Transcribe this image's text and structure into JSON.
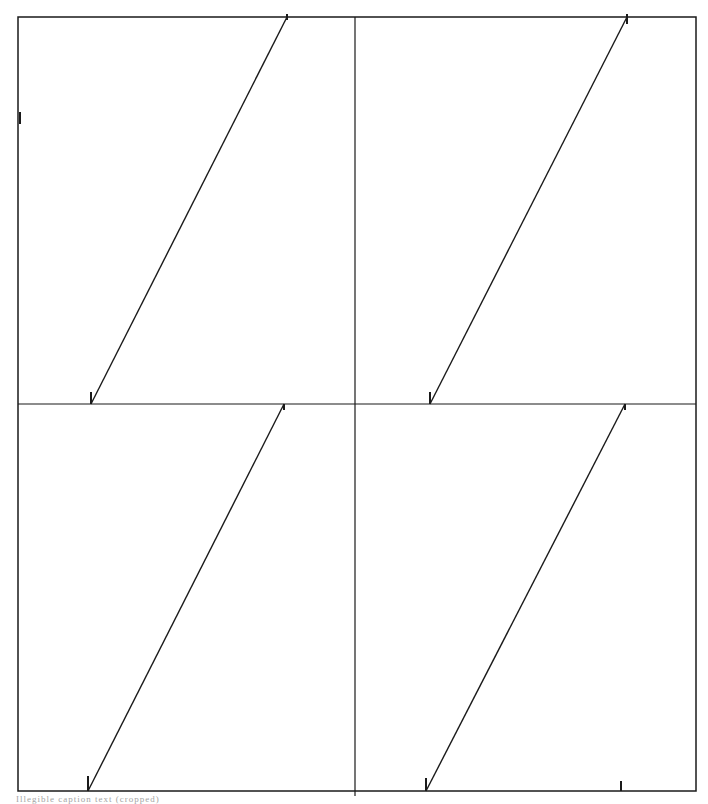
{
  "figure": {
    "stroke_color": "#1a1a1a",
    "background": "#ffffff",
    "frame": {
      "x1": 18,
      "y1": 17,
      "x2": 696,
      "y2": 791
    },
    "dividers": {
      "vertical_x": 355,
      "horizontal_y": 404
    },
    "panels": [
      {
        "id": "top-left",
        "line": {
          "x1": 91,
          "y1": 404,
          "x2": 287,
          "y2": 17
        },
        "ticks": [
          {
            "x": 91,
            "y1": 392,
            "y2": 404
          },
          {
            "x": 287,
            "y1": 14,
            "y2": 20
          }
        ]
      },
      {
        "id": "top-right",
        "line": {
          "x1": 430,
          "y1": 404,
          "x2": 627,
          "y2": 17
        },
        "ticks": [
          {
            "x": 430,
            "y1": 392,
            "y2": 404
          },
          {
            "x": 627,
            "y1": 14,
            "y2": 24
          }
        ]
      },
      {
        "id": "bottom-left",
        "line": {
          "x1": 88,
          "y1": 791,
          "x2": 284,
          "y2": 404
        },
        "ticks": [
          {
            "x": 88,
            "y1": 776,
            "y2": 791
          },
          {
            "x": 284,
            "y1": 404,
            "y2": 410
          }
        ]
      },
      {
        "id": "bottom-right",
        "line": {
          "x1": 426,
          "y1": 791,
          "x2": 625,
          "y2": 404
        },
        "ticks": [
          {
            "x": 426,
            "y1": 778,
            "y2": 791
          },
          {
            "x": 625,
            "y1": 404,
            "y2": 410
          }
        ]
      }
    ],
    "extra_marks": [
      {
        "id": "left-edge-tick",
        "x": 20,
        "y1": 112,
        "y2": 124
      },
      {
        "id": "bottom-right-tick",
        "x": 621,
        "y1": 781,
        "y2": 791
      }
    ]
  },
  "caption": {
    "text": "Illegible caption text (cropped)"
  }
}
